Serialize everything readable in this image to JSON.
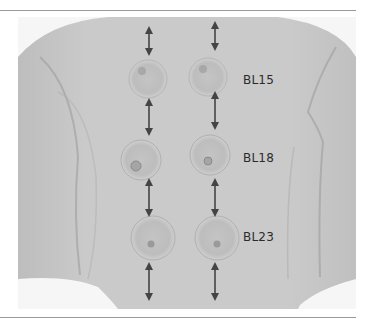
{
  "figure": {
    "labels": [
      {
        "text": "BL15"
      },
      {
        "text": "BL18"
      },
      {
        "text": "BL23"
      }
    ],
    "arrow_icon": "double-headed-vertical-arrow",
    "colors": {
      "skin": "#c9c9c9",
      "background": "#f6f6f6",
      "arrow": "#444444",
      "label": "#2b2b2b",
      "rule": "#9a9a9a"
    }
  }
}
